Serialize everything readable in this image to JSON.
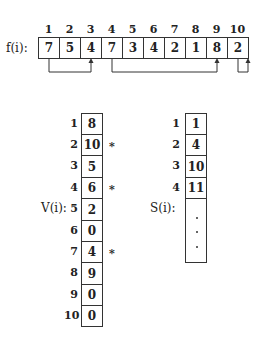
{
  "f_array": {
    "label": "f(i):",
    "indices": [
      "1",
      "2",
      "3",
      "4",
      "5",
      "6",
      "7",
      "8",
      "9",
      "10"
    ],
    "values": [
      "7",
      "5",
      "4",
      "7",
      "3",
      "4",
      "2",
      "1",
      "8",
      "2"
    ],
    "arrows": [
      {
        "from": 1,
        "to": 3
      },
      {
        "from": 4,
        "to": 9
      },
      {
        "from": 10,
        "to": 10
      }
    ]
  },
  "v_array": {
    "label": "V(i):",
    "rows": [
      {
        "index": "1",
        "value": "8",
        "mark": ""
      },
      {
        "index": "2",
        "value": "10",
        "mark": "*"
      },
      {
        "index": "3",
        "value": "5",
        "mark": ""
      },
      {
        "index": "4",
        "value": "6",
        "mark": "*"
      },
      {
        "index": "5",
        "value": "2",
        "mark": ""
      },
      {
        "index": "6",
        "value": "0",
        "mark": ""
      },
      {
        "index": "7",
        "value": "4",
        "mark": "*"
      },
      {
        "index": "8",
        "value": "9",
        "mark": ""
      },
      {
        "index": "9",
        "value": "0",
        "mark": ""
      },
      {
        "index": "10",
        "value": "0",
        "mark": ""
      }
    ]
  },
  "s_array": {
    "label": "S(i):",
    "rows": [
      {
        "index": "1",
        "value": "1"
      },
      {
        "index": "2",
        "value": "4"
      },
      {
        "index": "3",
        "value": "10"
      },
      {
        "index": "4",
        "value": "11"
      }
    ],
    "continuation": "⋮"
  }
}
